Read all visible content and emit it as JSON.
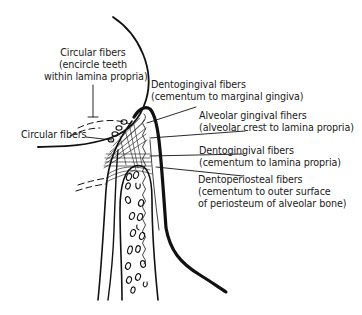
{
  "diagram": {
    "colors": {
      "line": "#111111",
      "background": "#ffffff"
    },
    "labels": [
      {
        "id": "circular-fibers-top",
        "lines": [
          "Circular fibers",
          "(encircle teeth",
          "within lamina propria)"
        ]
      },
      {
        "id": "circular-fibers-left",
        "lines": [
          "Circular fibers"
        ]
      },
      {
        "id": "dentogingival-marginal",
        "lines": [
          "Dentogingival fibers",
          "(cementum to marginal gingiva)"
        ]
      },
      {
        "id": "alveolar-gingival",
        "lines": [
          "Alveolar gingival fihers",
          "(alveolar crest to lamina propria)"
        ]
      },
      {
        "id": "dentogingival-lamina",
        "lines": [
          "Dentogingival fibers",
          "(cementum to lamina propria)"
        ]
      },
      {
        "id": "dentoperiosteal",
        "lines": [
          "Dentoperiosteal fibers",
          "(cementum to outer surface",
          "of periosteum of alveolar bone)"
        ]
      }
    ]
  }
}
